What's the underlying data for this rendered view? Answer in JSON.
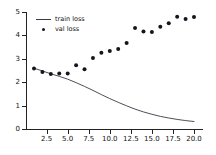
{
  "chart_data": {
    "type": "line",
    "title": "",
    "xlabel": "",
    "ylabel": "",
    "xlim": [
      0.05,
      20.95
    ],
    "ylim": [
      0.0,
      5.0
    ],
    "grid": false,
    "legend_position": "upper left",
    "xticks": [
      "2.5",
      "5.0",
      "7.5",
      "10.0",
      "12.5",
      "15.0",
      "17.5",
      "20.0"
    ],
    "xtick_values": [
      2.5,
      5.0,
      7.5,
      10.0,
      12.5,
      15.0,
      17.5,
      20.0
    ],
    "yticks": [
      "0",
      "1",
      "2",
      "3",
      "4",
      "5"
    ],
    "ytick_values": [
      0,
      1,
      2,
      3,
      4,
      5
    ],
    "x": [
      1,
      2,
      3,
      4,
      5,
      6,
      7,
      8,
      9,
      10,
      11,
      12,
      13,
      14,
      15,
      16,
      17,
      18,
      19,
      20
    ],
    "series": [
      {
        "name": "train loss",
        "style": "line",
        "color": "#3a3a46",
        "values": [
          2.6,
          2.48,
          2.36,
          2.25,
          2.13,
          1.98,
          1.82,
          1.65,
          1.47,
          1.3,
          1.14,
          0.99,
          0.85,
          0.73,
          0.63,
          0.54,
          0.47,
          0.41,
          0.36,
          0.32
        ]
      },
      {
        "name": "val loss",
        "style": "scatter",
        "color": "#15151c",
        "values": [
          2.59,
          2.44,
          2.35,
          2.37,
          2.37,
          2.72,
          2.55,
          3.03,
          3.26,
          3.33,
          3.42,
          3.68,
          4.32,
          4.17,
          4.15,
          4.37,
          4.52,
          4.8,
          4.7,
          4.79
        ]
      }
    ]
  },
  "legend": {
    "entries": [
      {
        "label": "train loss",
        "marker": "line"
      },
      {
        "label": "val loss",
        "marker": "dot"
      }
    ]
  }
}
